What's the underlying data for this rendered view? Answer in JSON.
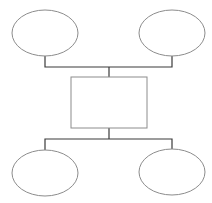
{
  "diagram": {
    "type": "hierarchy",
    "colors": {
      "background": "#ffffff",
      "shape_stroke": "#8c8c8c",
      "connector_stroke": "#3a3a3a"
    },
    "nodes": [
      {
        "id": "top-left",
        "shape": "ellipse",
        "label": "",
        "cx": 45,
        "cy": 33,
        "rx": 33,
        "ry": 23
      },
      {
        "id": "top-right",
        "shape": "ellipse",
        "label": "",
        "cx": 172,
        "cy": 33,
        "rx": 33,
        "ry": 23
      },
      {
        "id": "center",
        "shape": "rectangle",
        "label": "",
        "x": 71,
        "y": 77,
        "width": 76,
        "height": 51
      },
      {
        "id": "bottom-left",
        "shape": "ellipse",
        "label": "",
        "cx": 45,
        "cy": 173,
        "rx": 33,
        "ry": 23
      },
      {
        "id": "bottom-right",
        "shape": "ellipse",
        "label": "",
        "cx": 172,
        "cy": 172,
        "rx": 33,
        "ry": 23
      }
    ],
    "edges": [
      {
        "from": "top-left",
        "to": "center"
      },
      {
        "from": "top-right",
        "to": "center"
      },
      {
        "from": "center",
        "to": "bottom-left"
      },
      {
        "from": "center",
        "to": "bottom-right"
      }
    ]
  }
}
